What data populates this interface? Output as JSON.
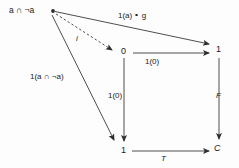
{
  "diagram": {
    "type": "commutative-diagram",
    "background_color": "#fdfdfd",
    "stroke_color": "#3a3a3a",
    "text_color": "#1a1a1a",
    "objects": [
      {
        "id": "top-left",
        "label": "a ∩ ¬a",
        "x": 30,
        "y": 11
      },
      {
        "id": "zero",
        "label": "0",
        "x": 124,
        "y": 52
      },
      {
        "id": "one-right",
        "label": "1",
        "x": 219,
        "y": 50
      },
      {
        "id": "one-bottom",
        "label": "1",
        "x": 124,
        "y": 151
      },
      {
        "id": "c",
        "label": "C",
        "x": 217,
        "y": 149
      }
    ],
    "arrows": [
      {
        "id": "top-to-one-right",
        "label": "1(a) ∘ g",
        "style": "solid",
        "from": "top-left",
        "to": "one-right"
      },
      {
        "id": "top-to-zero",
        "label": "i",
        "style": "dashed",
        "from": "top-left",
        "to": "zero"
      },
      {
        "id": "top-to-one-bottom",
        "label": "1(a ∩ ¬a)",
        "style": "solid",
        "from": "top-left",
        "to": "one-bottom"
      },
      {
        "id": "zero-to-one",
        "label": "1(0)",
        "style": "solid",
        "from": "zero",
        "to": "one-right"
      },
      {
        "id": "zero-to-bottom",
        "label": "1(0)",
        "style": "solid",
        "from": "zero",
        "to": "one-bottom"
      },
      {
        "id": "one-to-c",
        "label": "F",
        "style": "solid",
        "from": "one-right",
        "to": "c"
      },
      {
        "id": "bottom-to-c",
        "label": "T",
        "style": "solid",
        "from": "one-bottom",
        "to": "c"
      }
    ],
    "source_point": {
      "id": "source-dot",
      "x": 53,
      "y": 11
    }
  }
}
